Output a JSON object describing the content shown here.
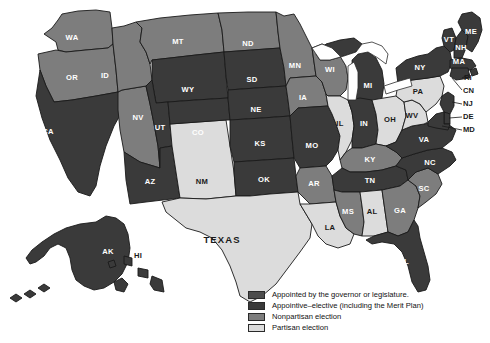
{
  "figure": {
    "type": "choropleth-map",
    "region": "United States",
    "background": "#ffffff"
  },
  "palette": {
    "appointed": "#4d4d4d",
    "appointive_elective": "#3a3a3a",
    "nonpartisan": "#7d7d7d",
    "partisan": "#dcdcdc",
    "water": "#ffffff",
    "outline": "#1a1a1a"
  },
  "legend": {
    "items": [
      {
        "label": "Appointed by the governor or legislature.",
        "color": "#4d4d4d",
        "key": "appointed"
      },
      {
        "label": "Appointive–elective (including the Merit Plan)",
        "color": "#3a3a3a",
        "key": "appointive_elective"
      },
      {
        "label": "Nonpartisan election",
        "color": "#7d7d7d",
        "key": "nonpartisan"
      },
      {
        "label": "Partisan election",
        "color": "#dcdcdc",
        "key": "partisan"
      }
    ]
  },
  "states": {
    "WA": {
      "label": "WA",
      "category": "nonpartisan",
      "color": "#7d7d7d",
      "label_color": "light"
    },
    "OR": {
      "label": "OR",
      "category": "nonpartisan",
      "color": "#7d7d7d",
      "label_color": "light"
    },
    "CA": {
      "label": "CA",
      "category": "appointive_elective",
      "color": "#3a3a3a",
      "label_color": "light"
    },
    "NV": {
      "label": "NV",
      "category": "nonpartisan",
      "color": "#7d7d7d",
      "label_color": "light"
    },
    "ID": {
      "label": "ID",
      "category": "nonpartisan",
      "color": "#7d7d7d",
      "label_color": "light"
    },
    "MT": {
      "label": "MT",
      "category": "nonpartisan",
      "color": "#7d7d7d",
      "label_color": "light"
    },
    "WY": {
      "label": "WY",
      "category": "appointive_elective",
      "color": "#3a3a3a",
      "label_color": "light"
    },
    "UT": {
      "label": "UT",
      "category": "appointive_elective",
      "color": "#3a3a3a",
      "label_color": "light"
    },
    "AZ": {
      "label": "AZ",
      "category": "appointive_elective",
      "color": "#3a3a3a",
      "label_color": "light"
    },
    "NM": {
      "label": "NM",
      "category": "partisan",
      "color": "#dcdcdc",
      "label_color": "dark"
    },
    "CO": {
      "label": "CO",
      "category": "appointive_elective",
      "color": "#3a3a3a",
      "label_color": "light"
    },
    "ND": {
      "label": "ND",
      "category": "nonpartisan",
      "color": "#7d7d7d",
      "label_color": "light"
    },
    "SD": {
      "label": "SD",
      "category": "appointive_elective",
      "color": "#3a3a3a",
      "label_color": "light"
    },
    "NE": {
      "label": "NE",
      "category": "appointive_elective",
      "color": "#3a3a3a",
      "label_color": "light"
    },
    "KS": {
      "label": "KS",
      "category": "appointive_elective",
      "color": "#3a3a3a",
      "label_color": "light"
    },
    "OK": {
      "label": "OK",
      "category": "appointive_elective",
      "color": "#3a3a3a",
      "label_color": "light"
    },
    "TX": {
      "label": "TEXAS",
      "category": "partisan",
      "color": "#dcdcdc",
      "label_color": "dark"
    },
    "MN": {
      "label": "MN",
      "category": "nonpartisan",
      "color": "#7d7d7d",
      "label_color": "light"
    },
    "IA": {
      "label": "IA",
      "category": "nonpartisan",
      "color": "#7d7d7d",
      "label_color": "light"
    },
    "MO": {
      "label": "MO",
      "category": "appointive_elective",
      "color": "#3a3a3a",
      "label_color": "light"
    },
    "AR": {
      "label": "AR",
      "category": "nonpartisan",
      "color": "#7d7d7d",
      "label_color": "light"
    },
    "LA": {
      "label": "LA",
      "category": "partisan",
      "color": "#dcdcdc",
      "label_color": "dark"
    },
    "WI": {
      "label": "WI",
      "category": "nonpartisan",
      "color": "#7d7d7d",
      "label_color": "light"
    },
    "IL": {
      "label": "IL",
      "category": "partisan",
      "color": "#dcdcdc",
      "label_color": "dark"
    },
    "MI": {
      "label": "MI",
      "category": "appointive_elective",
      "color": "#3a3a3a",
      "label_color": "light"
    },
    "IN": {
      "label": "IN",
      "category": "appointive_elective",
      "color": "#3a3a3a",
      "label_color": "light"
    },
    "OH": {
      "label": "OH",
      "category": "partisan",
      "color": "#dcdcdc",
      "label_color": "dark"
    },
    "KY": {
      "label": "KY",
      "category": "nonpartisan",
      "color": "#7d7d7d",
      "label_color": "light"
    },
    "TN": {
      "label": "TN",
      "category": "appointive_elective",
      "color": "#3a3a3a",
      "label_color": "light"
    },
    "MS": {
      "label": "MS",
      "category": "nonpartisan",
      "color": "#7d7d7d",
      "label_color": "light"
    },
    "AL": {
      "label": "AL",
      "category": "partisan",
      "color": "#dcdcdc",
      "label_color": "dark"
    },
    "GA": {
      "label": "GA",
      "category": "nonpartisan",
      "color": "#7d7d7d",
      "label_color": "light"
    },
    "FL": {
      "label": "FL",
      "category": "appointive_elective",
      "color": "#3a3a3a",
      "label_color": "light"
    },
    "SC": {
      "label": "SC",
      "category": "nonpartisan",
      "color": "#7d7d7d",
      "label_color": "light"
    },
    "NC": {
      "label": "NC",
      "category": "appointive_elective",
      "color": "#3a3a3a",
      "label_color": "light"
    },
    "VA": {
      "label": "VA",
      "category": "appointive_elective",
      "color": "#3a3a3a",
      "label_color": "light"
    },
    "WV": {
      "label": "WV",
      "category": "partisan",
      "color": "#dcdcdc",
      "label_color": "dark"
    },
    "PA": {
      "label": "PA",
      "category": "partisan",
      "color": "#dcdcdc",
      "label_color": "dark"
    },
    "NY": {
      "label": "NY",
      "category": "appointive_elective",
      "color": "#3a3a3a",
      "label_color": "light"
    },
    "VT": {
      "label": "VT",
      "category": "appointive_elective",
      "color": "#3a3a3a",
      "label_color": "light"
    },
    "NH": {
      "label": "NH",
      "category": "appointive_elective",
      "color": "#3a3a3a",
      "label_color": "light"
    },
    "MA": {
      "label": "MA",
      "category": "appointive_elective",
      "color": "#3a3a3a",
      "label_color": "light"
    },
    "ME": {
      "label": "ME",
      "category": "appointive_elective",
      "color": "#3a3a3a",
      "label_color": "light"
    },
    "RI": {
      "label": "RI",
      "category": "appointive_elective",
      "color": "#3a3a3a",
      "label_color": "dark"
    },
    "CN": {
      "label": "CN",
      "category": "appointive_elective",
      "color": "#3a3a3a",
      "label_color": "dark"
    },
    "NJ": {
      "label": "NJ",
      "category": "appointive_elective",
      "color": "#3a3a3a",
      "label_color": "dark"
    },
    "DE": {
      "label": "DE",
      "category": "appointive_elective",
      "color": "#3a3a3a",
      "label_color": "dark"
    },
    "MD": {
      "label": "MD",
      "category": "appointive_elective",
      "color": "#3a3a3a",
      "label_color": "dark"
    },
    "AK": {
      "label": "AK",
      "category": "appointive_elective",
      "color": "#3a3a3a",
      "label_color": "light"
    },
    "HI": {
      "label": "HI",
      "category": "appointive_elective",
      "color": "#3a3a3a",
      "label_color": "dark"
    }
  }
}
